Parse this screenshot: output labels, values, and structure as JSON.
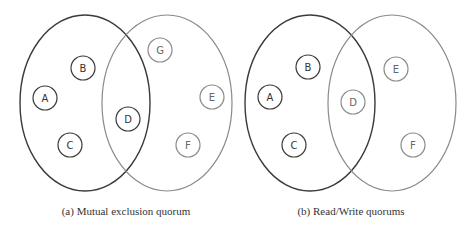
{
  "colors": {
    "dark_stroke": "#3a3a3a",
    "light_stroke": "#8a8a8a",
    "text_dark": "#333333",
    "text_light": "#666666"
  },
  "figures": [
    {
      "id": "a",
      "caption": "(a) Mutual exclusion quorum",
      "sets": [
        {
          "name": "quorum-1",
          "shade": "dark",
          "cx": 85,
          "cy": 103,
          "rx": 65,
          "ry": 88
        },
        {
          "name": "quorum-2",
          "shade": "light",
          "cx": 167,
          "cy": 103,
          "rx": 65,
          "ry": 88
        }
      ],
      "nodes": [
        {
          "label": "A",
          "shade": "dark",
          "cx": 45,
          "cy": 98
        },
        {
          "label": "B",
          "shade": "dark",
          "cx": 83,
          "cy": 68
        },
        {
          "label": "C",
          "shade": "dark",
          "cx": 70,
          "cy": 145
        },
        {
          "label": "D",
          "shade": "dark",
          "cx": 128,
          "cy": 119
        },
        {
          "label": "G",
          "shade": "light",
          "cx": 160,
          "cy": 50
        },
        {
          "label": "E",
          "shade": "light",
          "cx": 212,
          "cy": 97
        },
        {
          "label": "F",
          "shade": "light",
          "cx": 188,
          "cy": 145
        }
      ]
    },
    {
      "id": "b",
      "caption": "(b) Read/Write quorums",
      "sets": [
        {
          "name": "read-quorum",
          "shade": "dark",
          "cx": 310,
          "cy": 103,
          "rx": 65,
          "ry": 88
        },
        {
          "name": "write-quorum",
          "shade": "light",
          "cx": 392,
          "cy": 103,
          "rx": 64,
          "ry": 88
        }
      ],
      "nodes": [
        {
          "label": "A",
          "shade": "dark",
          "cx": 270,
          "cy": 97
        },
        {
          "label": "B",
          "shade": "dark",
          "cx": 308,
          "cy": 67
        },
        {
          "label": "C",
          "shade": "dark",
          "cx": 294,
          "cy": 145
        },
        {
          "label": "D",
          "shade": "light",
          "cx": 353,
          "cy": 102
        },
        {
          "label": "E",
          "shade": "light",
          "cx": 396,
          "cy": 69
        },
        {
          "label": "F",
          "shade": "light",
          "cx": 413,
          "cy": 145
        }
      ]
    }
  ]
}
